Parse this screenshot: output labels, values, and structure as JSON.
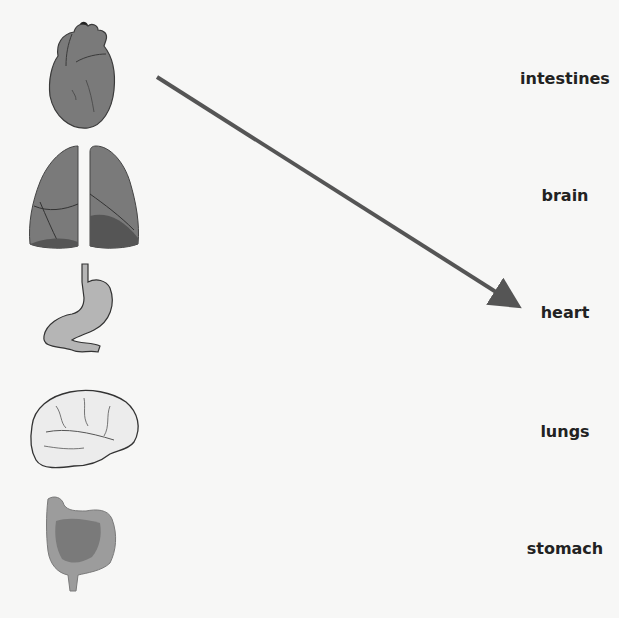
{
  "task": "match organ images to names",
  "images": [
    {
      "id": "heart",
      "icon": "heart-icon"
    },
    {
      "id": "lungs",
      "icon": "lungs-icon"
    },
    {
      "id": "stomach",
      "icon": "stomach-icon"
    },
    {
      "id": "brain",
      "icon": "brain-icon"
    },
    {
      "id": "intestines",
      "icon": "intestines-icon"
    }
  ],
  "labels": [
    "intestines",
    "brain",
    "heart",
    "lungs",
    "stomach"
  ],
  "connection": {
    "from": "heart image",
    "to": "heart",
    "color": "#555555"
  },
  "colors": {
    "organ_dark": "#6e6e6e",
    "organ_mid": "#8c8c8c",
    "organ_light": "#b5b5b5",
    "brain_fill": "#ececec"
  }
}
